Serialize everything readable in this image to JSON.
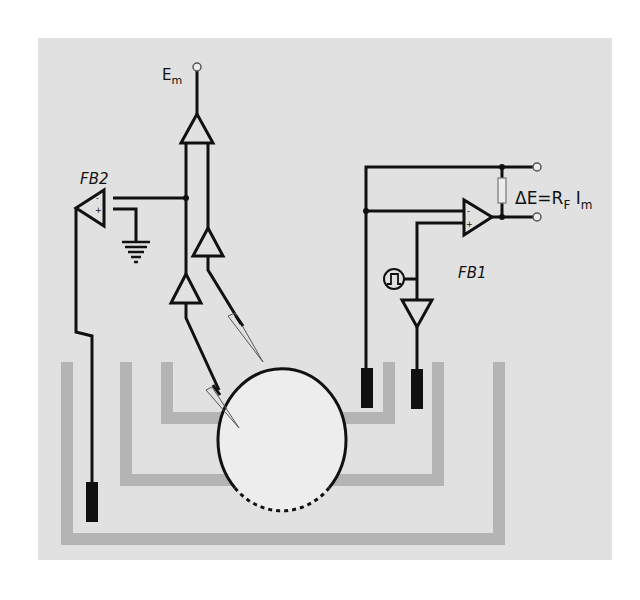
{
  "diagram": {
    "type": "electrophysiology voltage-clamp circuit schematic",
    "colors": {
      "background": "#e1e1e1",
      "wire": "#111111",
      "bath_wall": "#b4b4b4",
      "cell_fill": "#ededed",
      "electrode": "#111111"
    },
    "labels": {
      "em_main": "E",
      "em_sub": "m",
      "fb2": "FB2",
      "fb1": "FB1",
      "delta_e_main": "ΔE=R",
      "delta_e_rsub": "F",
      "delta_e_i": " I",
      "delta_e_isub": "m",
      "opamp_minus": "-",
      "opamp_plus": "+"
    },
    "components": [
      {
        "name": "Em output terminal",
        "kind": "terminal"
      },
      {
        "name": "Em buffer amplifier",
        "kind": "amplifier"
      },
      {
        "name": "Voltage electrode buffer 1",
        "kind": "amplifier"
      },
      {
        "name": "Voltage electrode buffer 2",
        "kind": "amplifier"
      },
      {
        "name": "FB2 op-amp",
        "kind": "op-amp"
      },
      {
        "name": "Ground",
        "kind": "ground"
      },
      {
        "name": "FB1 op-amp",
        "kind": "op-amp"
      },
      {
        "name": "Feedback resistor RF",
        "kind": "resistor"
      },
      {
        "name": "Pulse generator",
        "kind": "signal-source"
      },
      {
        "name": "Bath electrodes",
        "kind": "electrode",
        "count": 3
      },
      {
        "name": "Microelectrodes",
        "kind": "pipette",
        "count": 2
      },
      {
        "name": "Cell",
        "kind": "oocyte"
      },
      {
        "name": "Chamber",
        "kind": "nested bath walls",
        "count": 3
      }
    ]
  }
}
